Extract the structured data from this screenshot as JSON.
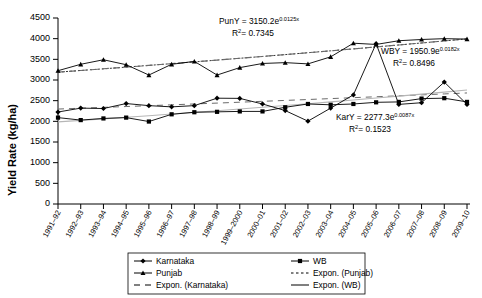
{
  "chart_data": {
    "type": "line",
    "title": "",
    "xlabel": "",
    "ylabel": "Yield Rate (kg/ha)",
    "ylim": [
      0,
      4500
    ],
    "yticks": [
      0,
      500,
      1000,
      1500,
      2000,
      2500,
      3000,
      3500,
      4000,
      4500
    ],
    "grid": false,
    "legend_position": "bottom",
    "categories": [
      "1991–92",
      "1992–93",
      "1993–94",
      "1994–95",
      "1995–96",
      "1996–97",
      "1997–98",
      "1998–99",
      "1999–2000",
      "2000–01",
      "2001–02",
      "2002–03",
      "2003–04",
      "2004–05",
      "2005–06",
      "2006–07",
      "2007–08",
      "2008–09",
      "2009–10"
    ],
    "series": [
      {
        "name": "Karnataka",
        "marker": "diamond",
        "values": [
          2225,
          2320,
          2310,
          2430,
          2380,
          2350,
          2380,
          2560,
          2555,
          2420,
          2260,
          2005,
          2320,
          2640,
          3880,
          2410,
          2450,
          2950,
          2410
        ]
      },
      {
        "name": "Punjab",
        "marker": "triangle",
        "values": [
          3225,
          3380,
          3490,
          3370,
          3120,
          3380,
          3450,
          3120,
          3300,
          3400,
          3420,
          3390,
          3560,
          3890,
          3860,
          3950,
          3980,
          4000,
          3990
        ]
      },
      {
        "name": "WB",
        "marker": "square",
        "values": [
          2090,
          2030,
          2070,
          2090,
          1995,
          2170,
          2220,
          2230,
          2240,
          2240,
          2340,
          2420,
          2400,
          2420,
          2460,
          2470,
          2550,
          2560,
          2470
        ]
      }
    ],
    "trendlines": [
      {
        "name": "Expon. (Karnataka)",
        "style": "long-dash",
        "equation": "KarY = 2277.3e",
        "exponent": "0.0087x",
        "r2_label": "R",
        "r2_value": "= 0.1523",
        "a": 2277.3,
        "b": 0.0087
      },
      {
        "name": "Expon. (Punjab)",
        "style": "dotted",
        "equation": "PunY = 3150.2e",
        "exponent": "0.0125x",
        "r2_label": "R",
        "r2_value": "= 0.7345",
        "a": 3150.2,
        "b": 0.0125
      },
      {
        "name": "Expon. (WB)",
        "style": "solid-grey",
        "equation": "WBY = 1950.9e",
        "exponent": "0.0182x",
        "r2_label": "R",
        "r2_value": "= 0.8496",
        "a": 1950.9,
        "b": 0.0182
      }
    ]
  },
  "annotations": {
    "punjab": {
      "eq_main": "PunY = 3150.2e",
      "eq_exp": "0.0125x",
      "r2_prefix": "R",
      "r2_sup": "2",
      "r2_rest": "= 0.7345"
    },
    "wb": {
      "eq_main": "WBY = 1950.9e",
      "eq_exp": "0.0182x",
      "r2_prefix": "R",
      "r2_sup": "2",
      "r2_rest": "= 0.8496"
    },
    "karnataka": {
      "eq_main": "KarY = 2277.3e",
      "eq_exp": "0.0087x",
      "r2_prefix": "R",
      "r2_sup": "2",
      "r2_rest": "= 0.1523"
    }
  },
  "legend": {
    "items": [
      {
        "label": "Karnataka",
        "marker": "diamond",
        "style": "solid"
      },
      {
        "label": "WB",
        "marker": "square",
        "style": "solid"
      },
      {
        "label": "Punjab",
        "marker": "triangle",
        "style": "solid"
      },
      {
        "label": "Expon. (Punjab)",
        "marker": "none",
        "style": "dotted"
      },
      {
        "label": "Expon. (Karnataka)",
        "marker": "none",
        "style": "long-dash"
      },
      {
        "label": "Expon. (WB)",
        "marker": "none",
        "style": "solid-grey"
      }
    ]
  },
  "axis": {
    "y_title": "Yield Rate (kg/ha)",
    "y_ticks": [
      "4500",
      "4000",
      "3500",
      "3000",
      "2500",
      "2000",
      "1500",
      "1000",
      "500",
      "0"
    ]
  }
}
